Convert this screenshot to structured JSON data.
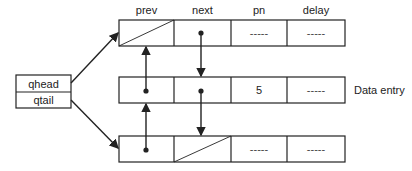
{
  "diagram": {
    "column_headers": [
      "prev",
      "next",
      "pn",
      "delay"
    ],
    "queue_pointers": {
      "head_label": "qhead",
      "tail_label": "qtail"
    },
    "nodes": [
      {
        "prev": "null",
        "next": "pointer",
        "pn": "-----",
        "delay": "-----"
      },
      {
        "prev": "pointer",
        "next": "pointer",
        "pn": "5",
        "delay": "-----",
        "side_label": "Data entry"
      },
      {
        "prev": "pointer",
        "next": "null",
        "pn": "-----",
        "delay": "-----"
      }
    ],
    "colors": {
      "line": "#222222",
      "background": "#ffffff"
    }
  }
}
